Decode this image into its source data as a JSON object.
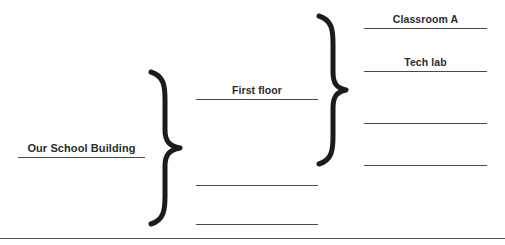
{
  "diagram": {
    "type": "bracket-outline",
    "orientation": "left-to-right",
    "root": {
      "id": "root",
      "label": "Our School Building",
      "filled": true,
      "x": 18,
      "y": 134,
      "width": 127,
      "height": 24
    },
    "level2": [
      {
        "id": "level2-1",
        "label": "First floor",
        "filled": true,
        "x": 196,
        "y": 76,
        "width": 122,
        "height": 24
      },
      {
        "id": "level2-2",
        "label": "",
        "filled": false,
        "x": 196,
        "y": 162,
        "width": 122,
        "height": 24
      },
      {
        "id": "level2-3",
        "label": "",
        "filled": false,
        "x": 196,
        "y": 201,
        "width": 122,
        "height": 24
      }
    ],
    "level3": [
      {
        "id": "level3-1",
        "label": "Classroom A",
        "filled": true,
        "x": 364,
        "y": 5,
        "width": 123,
        "height": 24
      },
      {
        "id": "level3-2",
        "label": "Tech lab",
        "filled": true,
        "x": 364,
        "y": 48,
        "width": 123,
        "height": 24
      },
      {
        "id": "level3-3",
        "label": "",
        "filled": false,
        "x": 364,
        "y": 100,
        "width": 123,
        "height": 24
      },
      {
        "id": "level3-4",
        "label": "",
        "filled": false,
        "x": 364,
        "y": 142,
        "width": 123,
        "height": 24
      }
    ],
    "braces": [
      {
        "id": "brace-root",
        "name": "root-brace",
        "x": 150,
        "y": 70,
        "width": 32,
        "height": 156,
        "stroke": "#1c1c1c",
        "stroke_width": 5
      },
      {
        "id": "brace-first-floor",
        "name": "first-floor-brace",
        "x": 318,
        "y": 14,
        "width": 30,
        "height": 152,
        "stroke": "#1c1c1c",
        "stroke_width": 5
      }
    ],
    "divider": {
      "id": "page-divider",
      "y": 238,
      "color": "#555555"
    },
    "colors": {
      "text": "#2b2b2b",
      "rule": "#4a4a4a",
      "brace": "#1c1c1c",
      "divider": "#555555",
      "background": "#ffffff"
    }
  }
}
